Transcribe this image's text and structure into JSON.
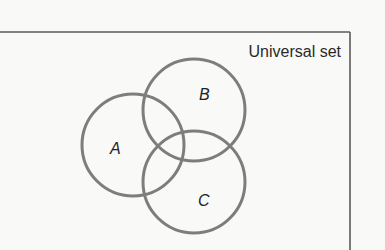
{
  "diagram": {
    "type": "venn",
    "universal_label": "Universal set",
    "colors": {
      "background": "#f9f9f8",
      "frame": "#5a5a5a",
      "circle_stroke": "#7d7d7d",
      "text": "#222222"
    },
    "sets": [
      {
        "id": "A",
        "label": "A",
        "cx": 133,
        "cy": 145,
        "r": 51,
        "label_x": 110,
        "label_y": 154
      },
      {
        "id": "B",
        "label": "B",
        "cx": 194,
        "cy": 110,
        "r": 51,
        "label_x": 199,
        "label_y": 100
      },
      {
        "id": "C",
        "label": "C",
        "cx": 194,
        "cy": 182,
        "r": 51,
        "label_x": 198,
        "label_y": 206
      }
    ]
  }
}
